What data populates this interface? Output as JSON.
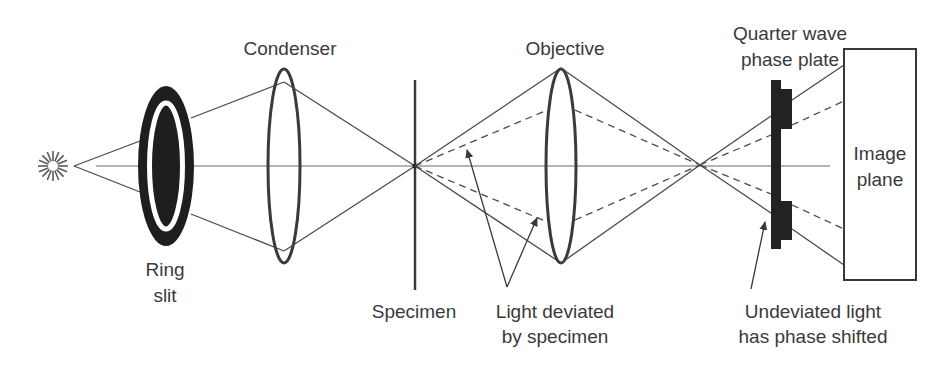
{
  "colors": {
    "ink": "#3a3a3a",
    "ring_slit_fill": "#1e1e1e",
    "phase_plate_fill": "#222222",
    "background": "#ffffff"
  },
  "icons": {
    "light_source": "starburst-icon"
  },
  "labels": {
    "ring_slit": {
      "line1": "Ring",
      "line2": "slit"
    },
    "condenser": "Condenser",
    "specimen": "Specimen",
    "objective": "Objective",
    "light_deviated": {
      "line1": "Light deviated",
      "line2": "by specimen"
    },
    "phase_plate": {
      "line1": "Quarter wave",
      "line2": "phase plate"
    },
    "undeviated": {
      "line1": "Undeviated light",
      "line2": "has phase shifted"
    },
    "image_plane": {
      "line1": "Image",
      "line2": "plane"
    }
  },
  "components": [
    {
      "id": "light-source",
      "label": ""
    },
    {
      "id": "ring-slit",
      "label": "Ring slit"
    },
    {
      "id": "condenser-lens",
      "label": "Condenser"
    },
    {
      "id": "specimen-plane",
      "label": "Specimen"
    },
    {
      "id": "objective-lens",
      "label": "Objective"
    },
    {
      "id": "phase-plate",
      "label": "Quarter wave phase plate"
    },
    {
      "id": "image-plane",
      "label": "Image plane"
    }
  ]
}
